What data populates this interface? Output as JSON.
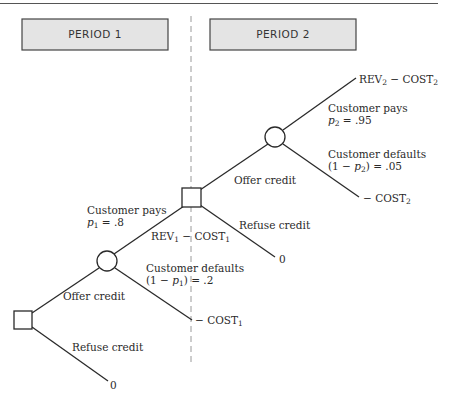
{
  "periods": {
    "period1": "PERIOD 1",
    "period2": "PERIOD 2"
  },
  "nodes": {
    "decision1": "decision",
    "chance1": "chance",
    "decision2": "decision",
    "chance2": "chance"
  },
  "branches": {
    "offer_credit_1": "Offer credit",
    "refuse_credit_1": "Refuse credit",
    "customer_pays_1": "Customer pays",
    "p1_label": "p",
    "p1_sub": "1",
    "p1_value": " = .8",
    "customer_defaults_1": "Customer defaults",
    "one_minus_p1_prefix": "(1 − ",
    "one_minus_p1_p": "p",
    "one_minus_p1_sub": "1",
    "one_minus_p1_value": ") = .2",
    "offer_credit_2": "Offer credit",
    "refuse_credit_2": "Refuse credit",
    "customer_pays_2": "Customer pays",
    "p2_label": "p",
    "p2_sub": "2",
    "p2_value": " = .95",
    "customer_defaults_2": "Customer defaults",
    "one_minus_p2_prefix": "(1 − ",
    "one_minus_p2_p": "p",
    "one_minus_p2_sub": "2",
    "one_minus_p2_value": ") = .05"
  },
  "outcomes": {
    "refuse1_value": "0",
    "default1_prefix": "− COST",
    "default1_sub": "1",
    "rev1_a": "REV",
    "rev1_a_sub": "1",
    "rev1_b": " − COST",
    "rev1_b_sub": "1",
    "refuse2_value": "0",
    "rev2_a": "REV",
    "rev2_a_sub": "2",
    "rev2_b": " − COST",
    "rev2_b_sub": "2",
    "default2_prefix": "− COST",
    "default2_sub": "2"
  },
  "colors": {
    "line": "#2a2a2a",
    "period_box_fill": "#e4e4e4",
    "dashed": "#9a9a9a"
  }
}
